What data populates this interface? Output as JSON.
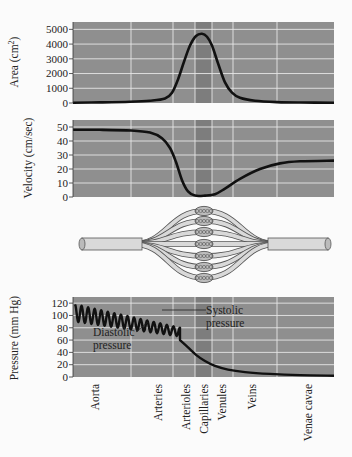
{
  "figure": {
    "background": "#fbfbfb",
    "panel_color": "#8f8f8f",
    "capillary_band_color": "#7d7d7d",
    "grid_color": "#e6e6e6",
    "curve_color": "#111111"
  },
  "regions": {
    "labels": [
      "Aorta",
      "Arteries",
      "Arterioles",
      "Capillaries",
      "Venules",
      "Veins",
      "Venae cavae"
    ],
    "label_x": [
      95,
      158,
      186,
      204,
      222,
      252,
      308
    ],
    "gridlines_x": [
      131,
      173,
      195,
      212,
      233,
      277
    ],
    "capillary_band_x": [
      195,
      212
    ]
  },
  "chart_data": [
    {
      "type": "line",
      "name": "area",
      "title": "",
      "xlabel": "",
      "ylabel": "Area (cm²)",
      "ylabel_text": "Area (cm",
      "ylabel_sup": "2",
      "ylabel_close": ")",
      "yticks": [
        0,
        1000,
        2000,
        3000,
        4000,
        5000
      ],
      "ylim": [
        0,
        5500
      ],
      "grid": true,
      "x": [
        73,
        100,
        130,
        150,
        165,
        172,
        178,
        184,
        190,
        196,
        202,
        207,
        212,
        218,
        225,
        232,
        240,
        255,
        277,
        300,
        334
      ],
      "values": [
        20,
        40,
        80,
        150,
        300,
        700,
        1600,
        2800,
        3900,
        4550,
        4700,
        4500,
        3900,
        2700,
        1400,
        700,
        350,
        150,
        60,
        30,
        20
      ]
    },
    {
      "type": "line",
      "name": "velocity",
      "title": "",
      "xlabel": "",
      "ylabel": "Velocity (cm/sec)",
      "yticks": [
        0,
        10,
        20,
        30,
        40,
        50
      ],
      "ylim": [
        0,
        55
      ],
      "grid": true,
      "x": [
        73,
        100,
        131,
        150,
        162,
        170,
        176,
        182,
        188,
        195,
        205,
        215,
        225,
        240,
        260,
        280,
        300,
        334
      ],
      "values": [
        48,
        48,
        47.5,
        46,
        42,
        35,
        25,
        12,
        4,
        1,
        1,
        2,
        6,
        13,
        20,
        24,
        25.5,
        26
      ]
    },
    {
      "type": "line",
      "name": "pressure",
      "title": "",
      "xlabel": "",
      "ylabel": "Pressure (mm Hg)",
      "yticks": [
        0,
        20,
        40,
        60,
        80,
        100,
        120
      ],
      "ylim": [
        0,
        130
      ],
      "grid": true,
      "oscillation": {
        "x_start": 75,
        "x_end": 180,
        "systolic_start": 118,
        "diastolic_start": 90,
        "systolic_end": 80,
        "diastolic_end": 66,
        "cycles": 16
      },
      "decay_x": [
        180,
        188,
        196,
        205,
        215,
        228,
        245,
        270,
        300,
        334
      ],
      "decay_values": [
        60,
        48,
        36,
        26,
        18,
        12,
        8,
        5,
        3,
        2
      ],
      "annotations": {
        "systolic": [
          "Systolic",
          "pressure"
        ],
        "diastolic": [
          "Diastolic",
          "pressure"
        ]
      }
    }
  ]
}
